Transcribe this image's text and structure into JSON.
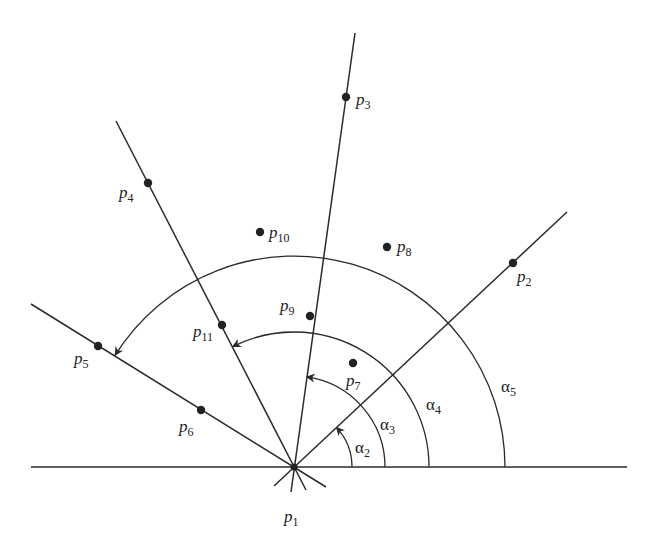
{
  "diagram": {
    "title": "",
    "origin": {
      "id": "p1",
      "x": 294,
      "y": 467
    },
    "baseline": {
      "x1": 31,
      "x2": 627,
      "y": 467
    },
    "rays": [
      {
        "to": "p2",
        "end": [
          567,
          212
        ],
        "stub": [
          274,
          486
        ]
      },
      {
        "to": "p3",
        "end": [
          355,
          33
        ],
        "stub": [
          291,
          492
        ]
      },
      {
        "to": "p4",
        "end": [
          116,
          121
        ],
        "stub": [
          306,
          490
        ]
      },
      {
        "to": "p5",
        "end": [
          31,
          304
        ],
        "stub": [
          326,
          487
        ]
      }
    ],
    "points": [
      {
        "id": "p1",
        "base": "p",
        "sub": "1",
        "x": 294,
        "y": 467,
        "label_x": 284,
        "label_y": 508
      },
      {
        "id": "p2",
        "base": "p",
        "sub": "2",
        "x": 513,
        "y": 263,
        "label_x": 517,
        "label_y": 268
      },
      {
        "id": "p3",
        "base": "p",
        "sub": "3",
        "x": 346,
        "y": 97,
        "label_x": 356,
        "label_y": 91
      },
      {
        "id": "p4",
        "base": "p",
        "sub": "4",
        "x": 148,
        "y": 183,
        "label_x": 119,
        "label_y": 184
      },
      {
        "id": "p5",
        "base": "p",
        "sub": "5",
        "x": 98,
        "y": 346,
        "label_x": 74,
        "label_y": 350
      },
      {
        "id": "p6",
        "base": "p",
        "sub": "6",
        "x": 201,
        "y": 410,
        "label_x": 179,
        "label_y": 418
      },
      {
        "id": "p7",
        "base": "p",
        "sub": "7",
        "x": 353,
        "y": 363,
        "label_x": 346,
        "label_y": 372
      },
      {
        "id": "p8",
        "base": "p",
        "sub": "8",
        "x": 387,
        "y": 247,
        "label_x": 397,
        "label_y": 238
      },
      {
        "id": "p9",
        "base": "p",
        "sub": "9",
        "x": 310,
        "y": 316,
        "label_x": 280,
        "label_y": 297
      },
      {
        "id": "p10",
        "base": "p",
        "sub": "10",
        "x": 260,
        "y": 232,
        "label_x": 269,
        "label_y": 224
      },
      {
        "id": "p11",
        "base": "p",
        "sub": "11",
        "x": 222,
        "y": 325,
        "label_x": 193,
        "label_y": 323
      }
    ],
    "angles": [
      {
        "id": "alpha2",
        "base": "α",
        "sub": "2",
        "radius": 58,
        "to_deg": 43,
        "label_x": 355,
        "label_y": 439
      },
      {
        "id": "alpha3",
        "base": "α",
        "sub": "3",
        "radius": 91,
        "to_deg": 82,
        "label_x": 380,
        "label_y": 416
      },
      {
        "id": "alpha4",
        "base": "α",
        "sub": "4",
        "radius": 135,
        "to_deg": 117,
        "label_x": 426,
        "label_y": 396
      },
      {
        "id": "alpha5",
        "base": "α",
        "sub": "5",
        "radius": 211,
        "to_deg": 148,
        "label_x": 501,
        "label_y": 378
      }
    ],
    "colors": {
      "ink": "#2a2a2a",
      "background": "#ffffff"
    }
  }
}
